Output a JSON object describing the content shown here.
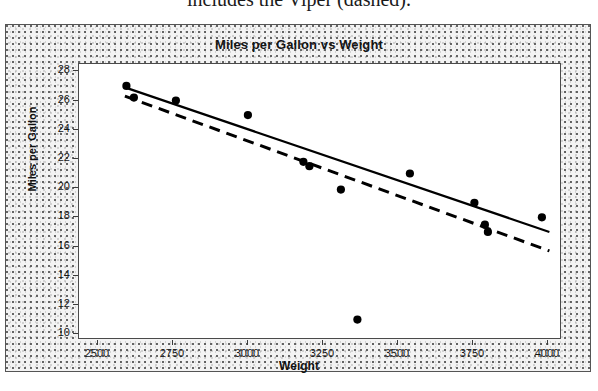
{
  "caption": {
    "text": "includes the Viper (dashed)."
  },
  "chart_data": {
    "type": "scatter",
    "title": "Miles per Gallon vs Weight",
    "xlabel": "Weight",
    "ylabel": "Miles per Gallon",
    "xlim": [
      2437,
      4047
    ],
    "ylim": [
      9.6,
      28.5
    ],
    "xticks": [
      2500,
      2750,
      3000,
      3250,
      3500,
      3750,
      4000
    ],
    "yticks": [
      10,
      12,
      14,
      16,
      18,
      20,
      22,
      24,
      26,
      28
    ],
    "grid": false,
    "legend": null,
    "points": [
      {
        "x": 2595,
        "y": 27.0
      },
      {
        "x": 2620,
        "y": 26.2
      },
      {
        "x": 2760,
        "y": 26.0
      },
      {
        "x": 3000,
        "y": 25.0
      },
      {
        "x": 3185,
        "y": 21.8
      },
      {
        "x": 3205,
        "y": 21.5
      },
      {
        "x": 3310,
        "y": 19.9
      },
      {
        "x": 3365,
        "y": 11.0
      },
      {
        "x": 3540,
        "y": 21.0
      },
      {
        "x": 3755,
        "y": 19.0
      },
      {
        "x": 3790,
        "y": 17.5
      },
      {
        "x": 3800,
        "y": 17.0
      },
      {
        "x": 3980,
        "y": 18.0
      }
    ],
    "series": [
      {
        "name": "solid-fit-line",
        "style": "solid",
        "x": [
          2590,
          4005
        ],
        "y": [
          26.9,
          17.0
        ]
      },
      {
        "name": "dashed-fit-line",
        "style": "dashed",
        "x": [
          2590,
          4005
        ],
        "y": [
          26.3,
          15.7
        ]
      }
    ]
  }
}
